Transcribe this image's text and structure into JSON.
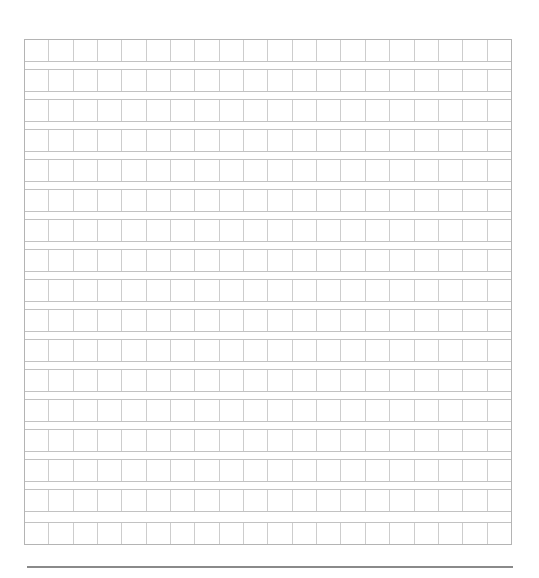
{
  "page": {
    "type": "composition-grid-paper",
    "rows": 17,
    "columns": 20,
    "cell_text": []
  },
  "colors": {
    "background": "#ffffff",
    "outer_border": "#b4b4b4",
    "inner_line": "#cdcdcd",
    "footer_rule": "#8a8a8a"
  }
}
